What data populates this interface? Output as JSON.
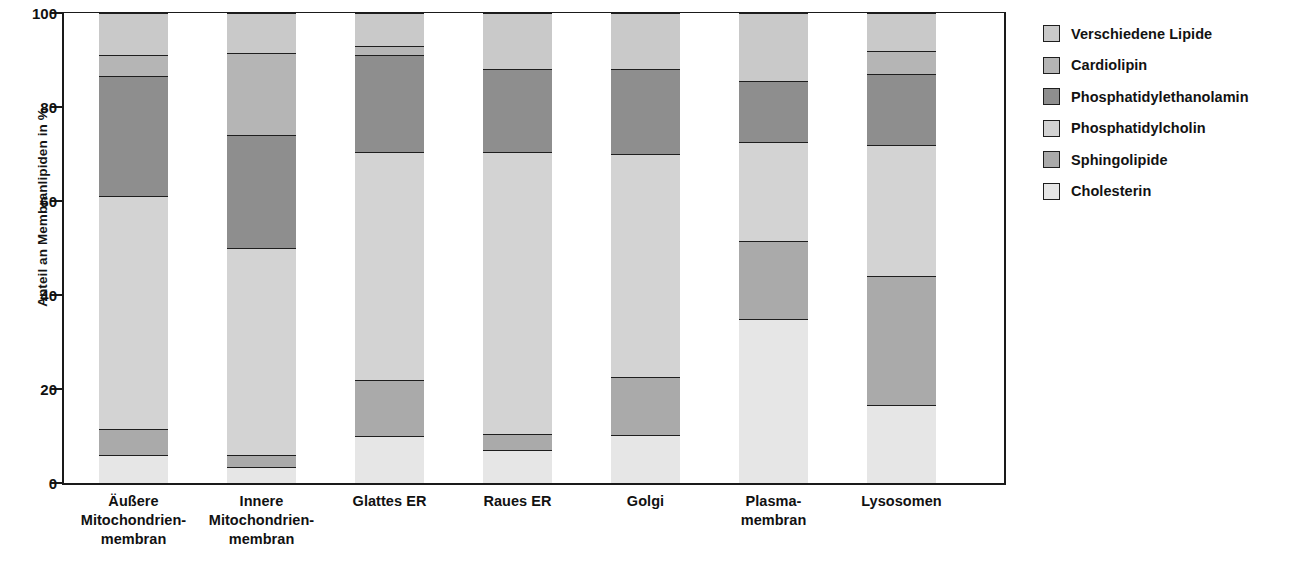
{
  "chart_data": {
    "type": "bar",
    "subtype": "stacked-bar-100",
    "title": "",
    "xlabel": "",
    "ylabel": "Anteil an Membranlipiden in %",
    "ylim": [
      0,
      100
    ],
    "yticks": [
      0,
      20,
      40,
      60,
      80,
      100
    ],
    "ytick_labels": [
      "0",
      "20",
      "40",
      "60",
      "80",
      "100"
    ],
    "grid": false,
    "legend_position": "right",
    "stack_order_bottom_to_top": [
      "Cholesterin",
      "Sphingolipide",
      "Phosphatidylcholin",
      "Phosphatidylethanolamin",
      "Cardiolipin",
      "Verschiedene Lipide"
    ],
    "categories": [
      "Äußere Mitochondrienmembran",
      "Innere Mitochondrienmembran",
      "Glattes ER",
      "Raues ER",
      "Golgi",
      "Plasmamembran",
      "Lysosomen"
    ],
    "series": [
      {
        "name": "Cholesterin",
        "values": [
          6.0,
          3.5,
          10.0,
          7.0,
          10.3,
          35.0,
          16.5
        ]
      },
      {
        "name": "Sphingolipide",
        "values": [
          5.5,
          2.5,
          12.0,
          3.5,
          12.2,
          16.5,
          27.5
        ]
      },
      {
        "name": "Phosphatidylcholin",
        "values": [
          49.5,
          44.0,
          48.5,
          60.0,
          47.5,
          21.0,
          28.0
        ]
      },
      {
        "name": "Phosphatidylethanolamin",
        "values": [
          25.5,
          24.0,
          20.5,
          17.5,
          18.0,
          13.0,
          15.0
        ]
      },
      {
        "name": "Cardiolipin",
        "values": [
          4.5,
          17.5,
          2.0,
          0.0,
          0.0,
          0.0,
          5.0
        ]
      },
      {
        "name": "Verschiedene Lipide",
        "values": [
          9.0,
          8.5,
          7.0,
          12.0,
          12.0,
          14.5,
          8.0
        ]
      }
    ],
    "cumulative_boundaries": [
      [
        0,
        6.0,
        11.5,
        61.0,
        86.5,
        91.0,
        100
      ],
      [
        0,
        3.5,
        6.0,
        50.0,
        74.0,
        91.5,
        100
      ],
      [
        0,
        10.0,
        22.0,
        70.5,
        91.0,
        93.0,
        100
      ],
      [
        0,
        7.0,
        10.5,
        70.5,
        88.0,
        88.0,
        100
      ],
      [
        0,
        10.3,
        22.5,
        70.0,
        88.0,
        88.0,
        100
      ],
      [
        0,
        35.0,
        51.5,
        72.5,
        85.5,
        85.5,
        100
      ],
      [
        0,
        16.5,
        44.0,
        72.0,
        87.0,
        92.0,
        100
      ]
    ]
  },
  "axis": {
    "y_title": "Anteil an Membranlipiden in %",
    "y_ticks": [
      "100",
      "80",
      "60",
      "40",
      "20",
      "0"
    ]
  },
  "x_categories": [
    {
      "lines": [
        "Äußere",
        "Mitochondrien-",
        "membran"
      ]
    },
    {
      "lines": [
        "Innere",
        "Mitochondrien-",
        "membran"
      ]
    },
    {
      "lines": [
        "Glattes ER"
      ]
    },
    {
      "lines": [
        "Raues ER"
      ]
    },
    {
      "lines": [
        "Golgi"
      ]
    },
    {
      "lines": [
        "Plasma-",
        "membran"
      ]
    },
    {
      "lines": [
        "Lysosomen"
      ]
    }
  ],
  "legend": {
    "items": [
      {
        "label": "Verschiedene Lipide",
        "color": "#c9c9c9"
      },
      {
        "label": "Cardiolipin",
        "color": "#b5b5b5"
      },
      {
        "label": "Phosphatidylethanolamin",
        "color": "#8e8e8e"
      },
      {
        "label": "Phosphatidylcholin",
        "color": "#d3d3d3"
      },
      {
        "label": "Sphingolipide",
        "color": "#aaaaaa"
      },
      {
        "label": "Cholesterin",
        "color": "#e6e6e6"
      }
    ]
  },
  "colors": {
    "verschiedene_lipide": "#c9c9c9",
    "cardiolipin": "#b5b5b5",
    "phosphatidylethanolamin": "#8e8e8e",
    "phosphatidylcholin": "#d3d3d3",
    "sphingolipide": "#aaaaaa",
    "cholesterin": "#e6e6e6",
    "axis": "#1a1a1a",
    "text": "#111111",
    "background": "#ffffff"
  }
}
